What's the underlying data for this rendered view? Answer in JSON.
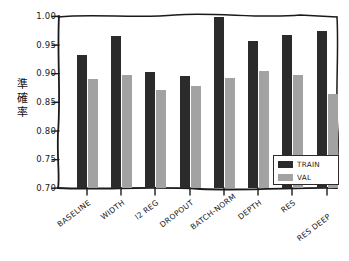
{
  "chart_data": {
    "type": "bar",
    "title": "",
    "xlabel": "",
    "ylabel": "準確率",
    "ylim": [
      0.7,
      1.0
    ],
    "yticks": [
      "0.70",
      "0.75",
      "0.80",
      "0.85",
      "0.90",
      "0.95",
      "1.00"
    ],
    "ytick_values": [
      0.7,
      0.75,
      0.8,
      0.85,
      0.9,
      0.95,
      1.0
    ],
    "grid": false,
    "legend_position": "lower right",
    "categories": [
      "BASELINE",
      "WIDTH",
      "l2 REG",
      "DROPOUT",
      "BATCH-NORM",
      "DEPTH",
      "RES",
      "RES DEEP"
    ],
    "series": [
      {
        "name": "TRAIN",
        "color": "#2b2b2b",
        "values": [
          0.932,
          0.965,
          0.902,
          0.895,
          0.999,
          0.956,
          0.968,
          0.974
        ]
      },
      {
        "name": "VAL",
        "color": "#a2a2a2",
        "values": [
          0.89,
          0.898,
          0.872,
          0.878,
          0.892,
          0.904,
          0.897,
          0.865
        ]
      }
    ]
  },
  "legend": {
    "entries": [
      {
        "label": "TRAIN",
        "swatch": "train"
      },
      {
        "label": "VAL",
        "swatch": "val"
      }
    ]
  },
  "style": {
    "train_color": "#2b2b2b",
    "val_color": "#a2a2a2",
    "axis_color": "#1a1a1a",
    "background": "#ffffff"
  }
}
